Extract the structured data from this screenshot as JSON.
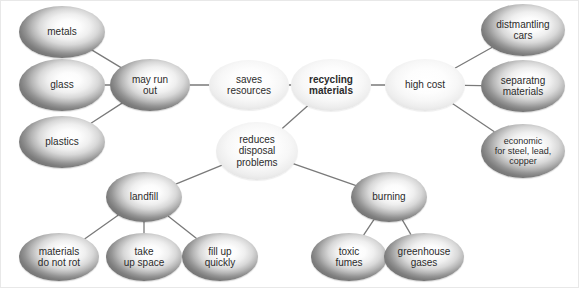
{
  "diagram": {
    "canvas": {
      "width": 579,
      "height": 288,
      "background": "#ffffff"
    },
    "styles": {
      "edge_color": "#7a7a7a",
      "text_color": "#2b2b2b",
      "dark_node_rim": "#767676",
      "pale_node_rim": "#dcdcdc"
    },
    "nodes": [
      {
        "id": "metals",
        "label": "metals",
        "shade": "dark",
        "bold": false,
        "cx": 61,
        "cy": 31,
        "rx": 43,
        "ry": 26,
        "font": 10
      },
      {
        "id": "glass",
        "label": "glass",
        "shade": "dark",
        "bold": false,
        "cx": 61,
        "cy": 84,
        "rx": 43,
        "ry": 26,
        "font": 10
      },
      {
        "id": "plastics",
        "label": "plastics",
        "shade": "dark",
        "bold": false,
        "cx": 61,
        "cy": 141,
        "rx": 43,
        "ry": 26,
        "font": 10
      },
      {
        "id": "may_run_out",
        "label": "may run\nout",
        "shade": "dark",
        "bold": false,
        "cx": 149,
        "cy": 84,
        "rx": 40,
        "ry": 26,
        "font": 10
      },
      {
        "id": "saves",
        "label": "saves\nresources",
        "shade": "pale",
        "bold": false,
        "cx": 248,
        "cy": 84,
        "rx": 40,
        "ry": 25,
        "font": 10
      },
      {
        "id": "recycling",
        "label": "recycling\nmaterials",
        "shade": "pale",
        "bold": true,
        "cx": 330,
        "cy": 84,
        "rx": 40,
        "ry": 26,
        "font": 10
      },
      {
        "id": "high_cost",
        "label": "high cost",
        "shade": "pale",
        "bold": false,
        "cx": 424,
        "cy": 84,
        "rx": 40,
        "ry": 26,
        "font": 10
      },
      {
        "id": "dismantling",
        "label": "distmantling\ncars",
        "shade": "dark",
        "bold": false,
        "cx": 522,
        "cy": 29,
        "rx": 42,
        "ry": 26,
        "font": 10
      },
      {
        "id": "separating",
        "label": "separatng\nmaterials",
        "shade": "dark",
        "bold": false,
        "cx": 522,
        "cy": 85,
        "rx": 42,
        "ry": 26,
        "font": 10
      },
      {
        "id": "economic",
        "label": "economic\nfor steel, lead,\ncopper",
        "shade": "dark",
        "bold": false,
        "cx": 522,
        "cy": 150,
        "rx": 42,
        "ry": 27,
        "font": 9
      },
      {
        "id": "reduces",
        "label": "reduces\ndisposal\nproblems",
        "shade": "pale",
        "bold": false,
        "cx": 256,
        "cy": 150,
        "rx": 41,
        "ry": 29,
        "font": 10
      },
      {
        "id": "landfill",
        "label": "landfill",
        "shade": "dark",
        "bold": false,
        "cx": 143,
        "cy": 196,
        "rx": 38,
        "ry": 25,
        "font": 10
      },
      {
        "id": "burning",
        "label": "burning",
        "shade": "dark",
        "bold": false,
        "cx": 388,
        "cy": 196,
        "rx": 38,
        "ry": 25,
        "font": 10
      },
      {
        "id": "not_rot",
        "label": "materials\ndo not rot",
        "shade": "dark",
        "bold": false,
        "cx": 58,
        "cy": 256,
        "rx": 40,
        "ry": 24,
        "font": 10
      },
      {
        "id": "take_space",
        "label": "take\nup space",
        "shade": "dark",
        "bold": false,
        "cx": 143,
        "cy": 256,
        "rx": 38,
        "ry": 24,
        "font": 10
      },
      {
        "id": "fill_up",
        "label": "fill up\nquickly",
        "shade": "dark",
        "bold": false,
        "cx": 219,
        "cy": 256,
        "rx": 38,
        "ry": 24,
        "font": 10
      },
      {
        "id": "toxic",
        "label": "toxic\nfumes",
        "shade": "dark",
        "bold": false,
        "cx": 348,
        "cy": 256,
        "rx": 38,
        "ry": 24,
        "font": 10
      },
      {
        "id": "greenhouse",
        "label": "greenhouse\ngases",
        "shade": "dark",
        "bold": false,
        "cx": 423,
        "cy": 256,
        "rx": 40,
        "ry": 24,
        "font": 10
      }
    ],
    "edges": [
      {
        "from": "metals",
        "to": "may_run_out"
      },
      {
        "from": "glass",
        "to": "may_run_out"
      },
      {
        "from": "plastics",
        "to": "may_run_out"
      },
      {
        "from": "may_run_out",
        "to": "saves"
      },
      {
        "from": "saves",
        "to": "recycling"
      },
      {
        "from": "recycling",
        "to": "high_cost"
      },
      {
        "from": "recycling",
        "to": "reduces"
      },
      {
        "from": "high_cost",
        "to": "dismantling"
      },
      {
        "from": "high_cost",
        "to": "separating"
      },
      {
        "from": "high_cost",
        "to": "economic"
      },
      {
        "from": "reduces",
        "to": "landfill"
      },
      {
        "from": "reduces",
        "to": "burning"
      },
      {
        "from": "landfill",
        "to": "not_rot"
      },
      {
        "from": "landfill",
        "to": "take_space"
      },
      {
        "from": "landfill",
        "to": "fill_up"
      },
      {
        "from": "burning",
        "to": "toxic"
      },
      {
        "from": "burning",
        "to": "greenhouse"
      }
    ]
  }
}
